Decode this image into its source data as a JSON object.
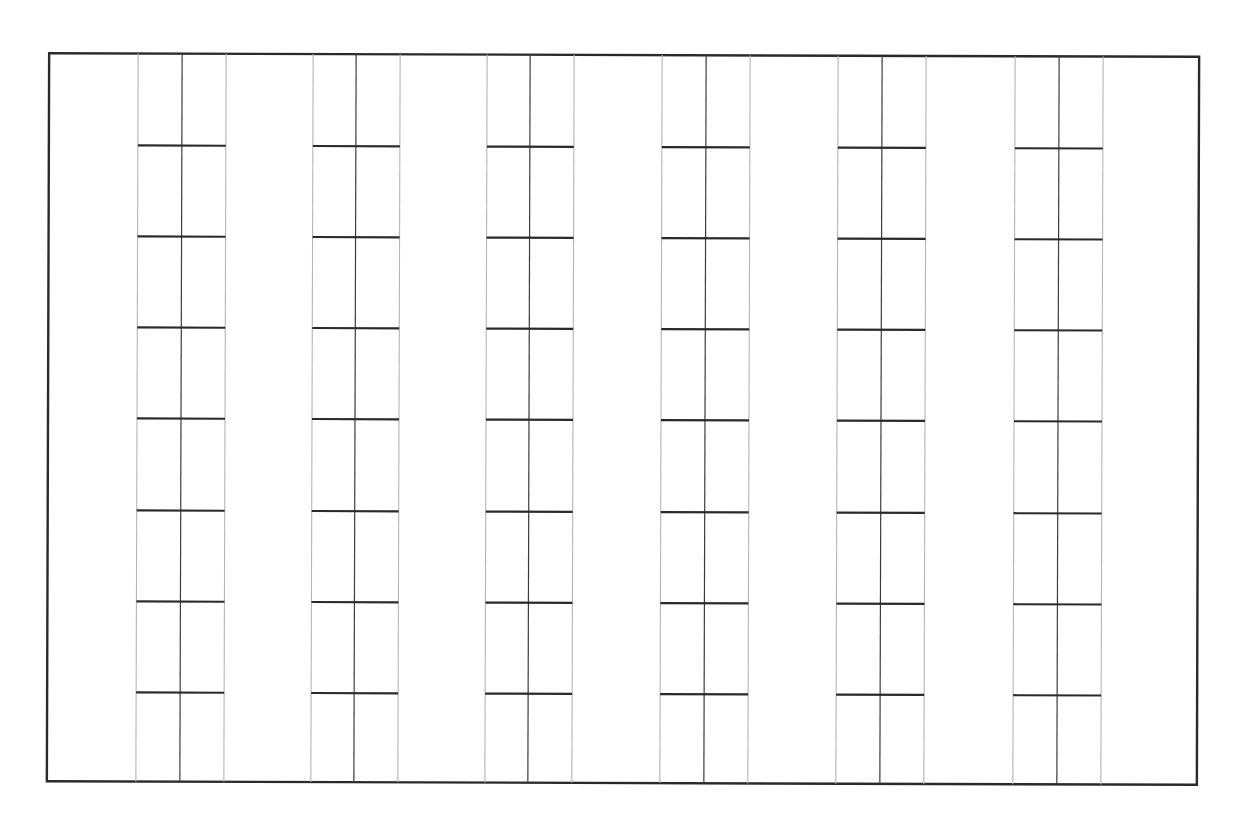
{
  "diagram": {
    "type": "ladder-grid",
    "frame": {
      "left": 48,
      "top": 55,
      "right": 1198,
      "bottom": 783
    },
    "columns": [
      {
        "left": 137,
        "center": 181,
        "right": 225
      },
      {
        "left": 312,
        "center": 355,
        "right": 399
      },
      {
        "left": 486,
        "center": 529,
        "right": 573
      },
      {
        "left": 661,
        "center": 705,
        "right": 749
      },
      {
        "left": 837,
        "center": 881,
        "right": 925
      },
      {
        "left": 1014,
        "center": 1058,
        "right": 1102
      }
    ],
    "rungs_y": [
      147,
      238,
      329,
      420,
      512,
      603,
      694
    ],
    "colors": {
      "frame": "#2a2a2a",
      "rail_side": "#b5b5b5",
      "rail_center": "#3c3c3c",
      "rung": "#2a2a2a",
      "background": "#ffffff"
    }
  }
}
